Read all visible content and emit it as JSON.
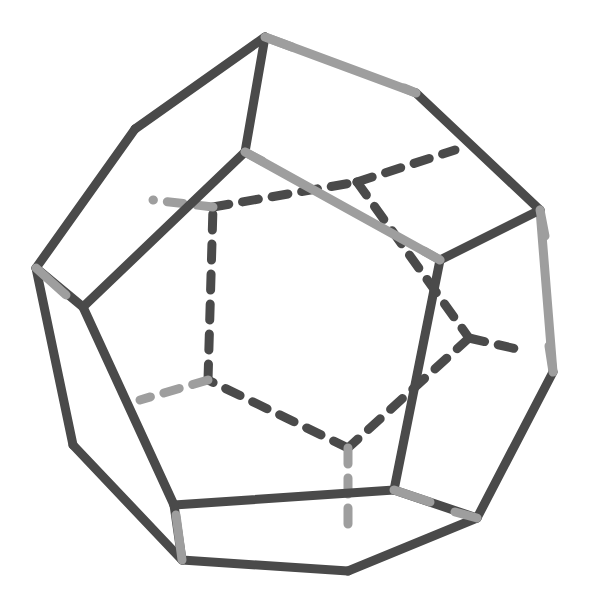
{
  "canvas": {
    "width": 593,
    "height": 594,
    "background": "#ffffff",
    "title": "Dodecahedron wireframe"
  },
  "style": {
    "visible_edge_color": "#4a4a4a",
    "hidden_edge_color": "#4a4a4a",
    "accent_light_color": "#9e9e9e",
    "accent_light_color2": "#a8a8a8",
    "stroke_width": 9,
    "hidden_stroke_width": 9,
    "dash_pattern": "16 14",
    "linecap": "round"
  },
  "figure": {
    "shape_name": "dodecahedron",
    "faces": 12,
    "vertices_count": 20,
    "edges_count": 30,
    "projection": "oblique perspective"
  },
  "vertices": {
    "outer_decagon": [
      {
        "id": "O1",
        "x": 265,
        "y": 37
      },
      {
        "id": "O2",
        "x": 416,
        "y": 93
      },
      {
        "id": "O3",
        "x": 540,
        "y": 210
      },
      {
        "id": "O4",
        "x": 553,
        "y": 372
      },
      {
        "id": "O5",
        "x": 477,
        "y": 518
      },
      {
        "id": "O6",
        "x": 348,
        "y": 571
      },
      {
        "id": "O7",
        "x": 182,
        "y": 560
      },
      {
        "id": "O8",
        "x": 73,
        "y": 445
      },
      {
        "id": "O9",
        "x": 36,
        "y": 268
      },
      {
        "id": "O10",
        "x": 135,
        "y": 129
      }
    ],
    "front_pentagon": [
      {
        "id": "F1",
        "x": 245,
        "y": 152
      },
      {
        "id": "F2",
        "x": 440,
        "y": 260
      },
      {
        "id": "F3",
        "x": 394,
        "y": 490
      },
      {
        "id": "F4",
        "x": 174,
        "y": 505
      },
      {
        "id": "F5",
        "x": 83,
        "y": 307
      }
    ],
    "back_pentagon": [
      {
        "id": "B1",
        "x": 357,
        "y": 182
      },
      {
        "id": "B2",
        "x": 469,
        "y": 338
      },
      {
        "id": "B3",
        "x": 348,
        "y": 448
      },
      {
        "id": "B4",
        "x": 208,
        "y": 380
      },
      {
        "id": "B5",
        "x": 213,
        "y": 207
      }
    ],
    "back_outer": [
      {
        "id": "K1",
        "x": 455,
        "y": 150
      },
      {
        "id": "K2",
        "x": 521,
        "y": 350
      },
      {
        "id": "K3",
        "x": 348,
        "y": 530
      },
      {
        "id": "K4",
        "x": 140,
        "y": 400
      },
      {
        "id": "K5",
        "x": 153,
        "y": 200
      }
    ]
  },
  "edges": [
    {
      "name": "outer-O1-O2",
      "from": "O1",
      "to": "O2",
      "kind": "visible",
      "color": "#9e9e9e"
    },
    {
      "name": "outer-O2-O3",
      "from": "O2",
      "to": "O3",
      "kind": "visible",
      "color": "#4a4a4a"
    },
    {
      "name": "outer-O3-O4",
      "from": "O3",
      "to": "O4",
      "kind": "visible",
      "color": "#9e9e9e"
    },
    {
      "name": "outer-O4-O5",
      "from": "O4",
      "to": "O5",
      "kind": "visible",
      "color": "#4a4a4a"
    },
    {
      "name": "outer-O5-O6",
      "from": "O5",
      "to": "O6",
      "kind": "visible",
      "color": "#4a4a4a"
    },
    {
      "name": "outer-O6-O7",
      "from": "O6",
      "to": "O7",
      "kind": "visible",
      "color": "#4a4a4a"
    },
    {
      "name": "outer-O7-O8",
      "from": "O7",
      "to": "O8",
      "kind": "visible",
      "color": "#4a4a4a"
    },
    {
      "name": "outer-O8-O9",
      "from": "O8",
      "to": "O9",
      "kind": "visible",
      "color": "#4a4a4a"
    },
    {
      "name": "outer-O9-O10",
      "from": "O9",
      "to": "O10",
      "kind": "visible",
      "color": "#4a4a4a"
    },
    {
      "name": "outer-O10-O1",
      "from": "O10",
      "to": "O1",
      "kind": "visible",
      "color": "#4a4a4a"
    },
    {
      "name": "spoke-O1-F1",
      "from": "O1",
      "to": "F1",
      "kind": "visible",
      "color": "#4a4a4a"
    },
    {
      "name": "spoke-O3-F2",
      "from": "O3",
      "to": "F2",
      "kind": "visible",
      "color": "#4a4a4a"
    },
    {
      "name": "spoke-O5-F3",
      "from": "O5",
      "to": "F3",
      "kind": "visible",
      "color": "#4a4a4a"
    },
    {
      "name": "spoke-O7-F4",
      "from": "O7",
      "to": "F4",
      "kind": "visible",
      "color": "#4a4a4a"
    },
    {
      "name": "spoke-O9-F5",
      "from": "O9",
      "to": "F5",
      "kind": "visible",
      "color": "#4a4a4a"
    },
    {
      "name": "front-F1-F2",
      "from": "F1",
      "to": "F2",
      "kind": "visible",
      "color": "#9e9e9e"
    },
    {
      "name": "front-F2-F3",
      "from": "F2",
      "to": "F3",
      "kind": "visible",
      "color": "#4a4a4a"
    },
    {
      "name": "front-F3-F4",
      "from": "F3",
      "to": "F4",
      "kind": "visible",
      "color": "#4a4a4a"
    },
    {
      "name": "front-F4-F5",
      "from": "F4",
      "to": "F5",
      "kind": "visible",
      "color": "#4a4a4a"
    },
    {
      "name": "front-F5-F1",
      "from": "F5",
      "to": "F1",
      "kind": "visible",
      "color": "#4a4a4a"
    },
    {
      "name": "hidden-B1-B2",
      "from": "B1",
      "to": "B2",
      "kind": "hidden",
      "color": "#4a4a4a"
    },
    {
      "name": "hidden-B2-B3",
      "from": "B2",
      "to": "B3",
      "kind": "hidden",
      "color": "#4a4a4a"
    },
    {
      "name": "hidden-B3-B4",
      "from": "B3",
      "to": "B4",
      "kind": "hidden",
      "color": "#4a4a4a"
    },
    {
      "name": "hidden-B4-B5",
      "from": "B4",
      "to": "B5",
      "kind": "hidden",
      "color": "#4a4a4a"
    },
    {
      "name": "hidden-B5-B1",
      "from": "B5",
      "to": "B1",
      "kind": "hidden",
      "color": "#4a4a4a"
    },
    {
      "name": "hidden-spoke-B1-K1",
      "from": "B1",
      "to": "K1",
      "kind": "hidden",
      "color": "#4a4a4a"
    },
    {
      "name": "hidden-spoke-B2-K2",
      "from": "B2",
      "to": "K2",
      "kind": "hidden",
      "color": "#4a4a4a"
    },
    {
      "name": "hidden-spoke-B3-K3",
      "from": "B3",
      "to": "K3",
      "kind": "hidden",
      "color": "#9e9e9e"
    },
    {
      "name": "hidden-spoke-B4-K4",
      "from": "B4",
      "to": "K4",
      "kind": "hidden",
      "color": "#9e9e9e"
    },
    {
      "name": "hidden-spoke-B5-K5",
      "from": "B5",
      "to": "K5",
      "kind": "hidden",
      "color": "#9e9e9e"
    }
  ],
  "joint_caps": [
    {
      "name": "cap-O1",
      "x1": 265,
      "y1": 37,
      "x2": 292,
      "y2": 47,
      "color": "#9e9e9e"
    },
    {
      "name": "cap-O2",
      "x1": 404,
      "y1": 88,
      "x2": 416,
      "y2": 93,
      "color": "#9e9e9e"
    },
    {
      "name": "cap-O3",
      "x1": 540,
      "y1": 210,
      "x2": 545,
      "y2": 236,
      "color": "#9e9e9e"
    },
    {
      "name": "cap-O9",
      "x1": 36,
      "y1": 268,
      "x2": 66,
      "y2": 295,
      "color": "#9e9e9e"
    },
    {
      "name": "cap-O7",
      "x1": 176,
      "y1": 515,
      "x2": 182,
      "y2": 560,
      "color": "#9e9e9e"
    },
    {
      "name": "cap-F2",
      "x1": 440,
      "y1": 260,
      "x2": 424,
      "y2": 251,
      "color": "#9e9e9e"
    },
    {
      "name": "cap-F3",
      "x1": 394,
      "y1": 490,
      "x2": 430,
      "y2": 502,
      "color": "#9e9e9e"
    },
    {
      "name": "cap-F1",
      "x1": 245,
      "y1": 152,
      "x2": 262,
      "y2": 161,
      "color": "#9e9e9e"
    },
    {
      "name": "cap-O4",
      "x1": 549,
      "y1": 346,
      "x2": 553,
      "y2": 372,
      "color": "#9e9e9e"
    },
    {
      "name": "cap-O5",
      "x1": 455,
      "y1": 512,
      "x2": 477,
      "y2": 518,
      "color": "#9e9e9e"
    }
  ]
}
